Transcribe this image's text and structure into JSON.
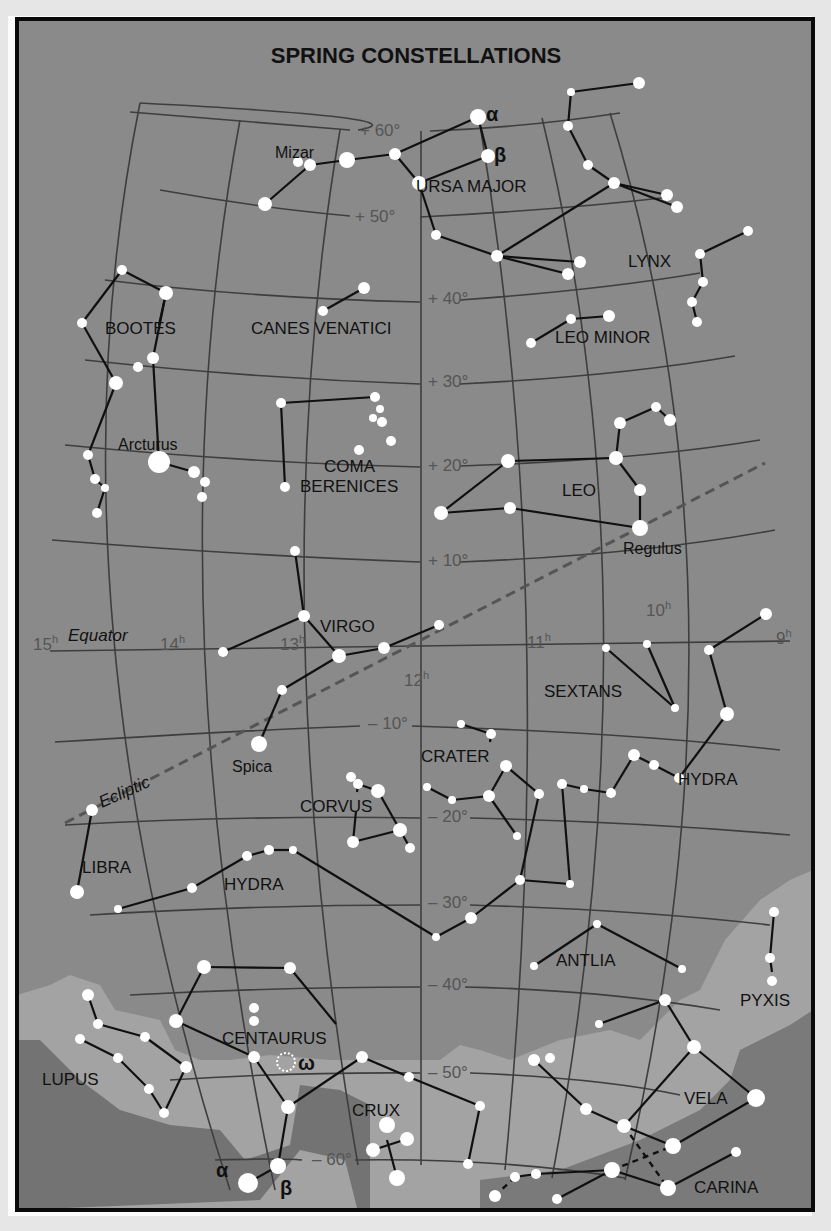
{
  "title": "SPRING CONSTELLATIONS",
  "colors": {
    "background": "#8a8a8a",
    "milky_way_light": "#a3a3a3",
    "milky_way_dark": "#6f6f6f",
    "grid": "#3e3e3e",
    "line": "#101010",
    "star": "#ffffff",
    "ecliptic": "#555555",
    "border": "#0a0a0a"
  },
  "grid_labels": {
    "dec": [
      {
        "text": "+ 60°",
        "x": 360,
        "y": 136
      },
      {
        "text": "+ 50°",
        "x": 355,
        "y": 222
      },
      {
        "text": "+ 40°",
        "x": 428,
        "y": 304
      },
      {
        "text": "+ 30°",
        "x": 428,
        "y": 387
      },
      {
        "text": "+ 20°",
        "x": 428,
        "y": 471
      },
      {
        "text": "+ 10°",
        "x": 428,
        "y": 566
      },
      {
        "text": "– 10°",
        "x": 368,
        "y": 729
      },
      {
        "text": "– 20°",
        "x": 428,
        "y": 822
      },
      {
        "text": "– 30°",
        "x": 428,
        "y": 908
      },
      {
        "text": "– 40°",
        "x": 428,
        "y": 990
      },
      {
        "text": "– 50°",
        "x": 428,
        "y": 1078
      },
      {
        "text": "– 60°",
        "x": 312,
        "y": 1165
      }
    ],
    "ra": [
      {
        "text": "15h",
        "x": 33,
        "y": 650
      },
      {
        "text": "14h",
        "x": 160,
        "y": 650
      },
      {
        "text": "13h",
        "x": 280,
        "y": 650
      },
      {
        "text": "12h",
        "x": 404,
        "y": 686
      },
      {
        "text": "11h",
        "x": 527,
        "y": 648
      },
      {
        "text": "10h",
        "x": 646,
        "y": 616
      },
      {
        "text": "9h",
        "x": 776,
        "y": 644
      }
    ]
  },
  "special_labels": {
    "equator": "Equator",
    "ecliptic": "Ecliptic"
  },
  "constellations": [
    {
      "name": "URSA MAJOR",
      "x": 416,
      "y": 192
    },
    {
      "name": "LYNX",
      "x": 628,
      "y": 267
    },
    {
      "name": "LEO MINOR",
      "x": 555,
      "y": 343
    },
    {
      "name": "BOOTES",
      "x": 105,
      "y": 334
    },
    {
      "name": "CANES VENATICI",
      "x": 251,
      "y": 334
    },
    {
      "name": "COMA",
      "x": 324,
      "y": 472
    },
    {
      "name": "BERENICES",
      "x": 300,
      "y": 492
    },
    {
      "name": "LEO",
      "x": 562,
      "y": 496
    },
    {
      "name": "VIRGO",
      "x": 320,
      "y": 632
    },
    {
      "name": "SEXTANS",
      "x": 544,
      "y": 697
    },
    {
      "name": "CRATER",
      "x": 421,
      "y": 762
    },
    {
      "name": "HYDRA",
      "x": 678,
      "y": 785
    },
    {
      "name": "CORVUS",
      "x": 300,
      "y": 812
    },
    {
      "name": "LIBRA",
      "x": 82,
      "y": 873
    },
    {
      "name": "HYDRA",
      "x": 224,
      "y": 890
    },
    {
      "name": "ANTLIA",
      "x": 556,
      "y": 966
    },
    {
      "name": "PYXIS",
      "x": 740,
      "y": 1006
    },
    {
      "name": "CENTAURUS",
      "x": 222,
      "y": 1044
    },
    {
      "name": "LUPUS",
      "x": 42,
      "y": 1085
    },
    {
      "name": "CRUX",
      "x": 352,
      "y": 1116
    },
    {
      "name": "VELA",
      "x": 684,
      "y": 1104
    },
    {
      "name": "CARINA",
      "x": 694,
      "y": 1193
    }
  ],
  "star_names": [
    {
      "name": "Mizar",
      "x": 275,
      "y": 158
    },
    {
      "name": "Arcturus",
      "x": 118,
      "y": 450
    },
    {
      "name": "Regulus",
      "x": 623,
      "y": 554
    },
    {
      "name": "Spica",
      "x": 232,
      "y": 772
    }
  ],
  "greek_labels": [
    {
      "text": "α",
      "x": 486,
      "y": 121
    },
    {
      "text": "β",
      "x": 494,
      "y": 162
    },
    {
      "text": "ω",
      "x": 298,
      "y": 1070
    },
    {
      "text": "α",
      "x": 216,
      "y": 1177
    },
    {
      "text": "β",
      "x": 280,
      "y": 1195
    }
  ],
  "stars": [
    [
      478,
      117,
      8
    ],
    [
      488,
      156,
      7
    ],
    [
      419,
      183,
      7
    ],
    [
      395,
      154,
      6
    ],
    [
      347,
      160,
      8
    ],
    [
      310,
      165,
      6
    ],
    [
      298,
      162,
      5
    ],
    [
      265,
      204,
      7
    ],
    [
      436,
      235,
      5
    ],
    [
      497,
      256,
      6
    ],
    [
      568,
      274,
      6
    ],
    [
      580,
      262,
      6
    ],
    [
      571,
      92,
      4
    ],
    [
      639,
      83,
      6
    ],
    [
      568,
      126,
      5
    ],
    [
      588,
      165,
      5
    ],
    [
      614,
      183,
      6
    ],
    [
      677,
      207,
      6
    ],
    [
      667,
      195,
      6
    ],
    [
      700,
      254,
      5
    ],
    [
      748,
      231,
      5
    ],
    [
      703,
      282,
      5
    ],
    [
      692,
      302,
      5
    ],
    [
      697,
      322,
      5
    ],
    [
      531,
      343,
      5
    ],
    [
      571,
      319,
      5
    ],
    [
      609,
      316,
      6
    ],
    [
      122,
      270,
      5
    ],
    [
      166,
      293,
      7
    ],
    [
      82,
      323,
      5
    ],
    [
      153,
      358,
      6
    ],
    [
      138,
      367,
      5
    ],
    [
      116,
      383,
      7
    ],
    [
      159,
      462,
      11
    ],
    [
      194,
      472,
      6
    ],
    [
      205,
      482,
      5
    ],
    [
      202,
      497,
      5
    ],
    [
      88,
      455,
      5
    ],
    [
      95,
      479,
      5
    ],
    [
      105,
      488,
      4
    ],
    [
      97,
      513,
      5
    ],
    [
      323,
      311,
      5
    ],
    [
      364,
      288,
      6
    ],
    [
      281,
      403,
      5
    ],
    [
      375,
      397,
      5
    ],
    [
      380,
      409,
      4
    ],
    [
      373,
      418,
      4
    ],
    [
      382,
      422,
      5
    ],
    [
      391,
      441,
      5
    ],
    [
      359,
      450,
      5
    ],
    [
      285,
      487,
      5
    ],
    [
      508,
      461,
      7
    ],
    [
      616,
      458,
      7
    ],
    [
      620,
      423,
      6
    ],
    [
      656,
      407,
      5
    ],
    [
      670,
      420,
      6
    ],
    [
      640,
      490,
      6
    ],
    [
      640,
      528,
      8
    ],
    [
      510,
      508,
      6
    ],
    [
      441,
      513,
      7
    ],
    [
      295,
      551,
      5
    ],
    [
      304,
      616,
      6
    ],
    [
      339,
      656,
      7
    ],
    [
      384,
      648,
      6
    ],
    [
      439,
      625,
      5
    ],
    [
      282,
      690,
      5
    ],
    [
      259,
      744,
      8
    ],
    [
      223,
      652,
      5
    ],
    [
      606,
      648,
      4
    ],
    [
      647,
      644,
      4
    ],
    [
      675,
      708,
      4
    ],
    [
      709,
      650,
      5
    ],
    [
      766,
      614,
      6
    ],
    [
      727,
      714,
      7
    ],
    [
      461,
      724,
      4
    ],
    [
      491,
      734,
      5
    ],
    [
      506,
      766,
      6
    ],
    [
      489,
      796,
      6
    ],
    [
      452,
      800,
      4
    ],
    [
      427,
      787,
      4
    ],
    [
      517,
      836,
      4
    ],
    [
      539,
      794,
      5
    ],
    [
      351,
      777,
      5
    ],
    [
      358,
      784,
      5
    ],
    [
      378,
      791,
      7
    ],
    [
      353,
      842,
      6
    ],
    [
      400,
      830,
      7
    ],
    [
      410,
      848,
      5
    ],
    [
      562,
      784,
      5
    ],
    [
      584,
      789,
      4
    ],
    [
      611,
      793,
      5
    ],
    [
      634,
      755,
      6
    ],
    [
      654,
      765,
      5
    ],
    [
      679,
      778,
      5
    ],
    [
      92,
      810,
      6
    ],
    [
      77,
      892,
      7
    ],
    [
      118,
      909,
      4
    ],
    [
      192,
      888,
      5
    ],
    [
      247,
      856,
      5
    ],
    [
      269,
      850,
      5
    ],
    [
      293,
      850,
      4
    ],
    [
      436,
      937,
      4
    ],
    [
      471,
      918,
      6
    ],
    [
      520,
      880,
      5
    ],
    [
      570,
      884,
      4
    ],
    [
      597,
      924,
      4
    ],
    [
      534,
      966,
      4
    ],
    [
      682,
      969,
      4
    ],
    [
      774,
      912,
      5
    ],
    [
      770,
      958,
      5
    ],
    [
      772,
      981,
      5
    ],
    [
      204,
      967,
      7
    ],
    [
      290,
      968,
      6
    ],
    [
      254,
      1008,
      5
    ],
    [
      254,
      1021,
      5
    ],
    [
      176,
      1021,
      7
    ],
    [
      254,
      1057,
      6
    ],
    [
      362,
      1057,
      6
    ],
    [
      288,
      1107,
      7
    ],
    [
      278,
      1166,
      8
    ],
    [
      248,
      1183,
      10
    ],
    [
      409,
      1077,
      5
    ],
    [
      480,
      1106,
      5
    ],
    [
      88,
      995,
      6
    ],
    [
      98,
      1024,
      5
    ],
    [
      80,
      1039,
      5
    ],
    [
      118,
      1058,
      5
    ],
    [
      145,
      1037,
      5
    ],
    [
      149,
      1089,
      5
    ],
    [
      186,
      1067,
      6
    ],
    [
      164,
      1113,
      5
    ],
    [
      387,
      1125,
      8
    ],
    [
      407,
      1139,
      7
    ],
    [
      373,
      1150,
      7
    ],
    [
      397,
      1178,
      8
    ],
    [
      468,
      1164,
      5
    ],
    [
      599,
      1024,
      4
    ],
    [
      665,
      1000,
      6
    ],
    [
      694,
      1047,
      7
    ],
    [
      534,
      1060,
      6
    ],
    [
      550,
      1058,
      5
    ],
    [
      586,
      1109,
      6
    ],
    [
      624,
      1126,
      7
    ],
    [
      673,
      1146,
      8
    ],
    [
      756,
      1098,
      9
    ],
    [
      612,
      1170,
      8
    ],
    [
      668,
      1188,
      8
    ],
    [
      736,
      1152,
      5
    ],
    [
      536,
      1174,
      5
    ],
    [
      515,
      1177,
      5
    ],
    [
      495,
      1196,
      6
    ],
    [
      557,
      1199,
      5
    ]
  ],
  "lines": [
    [
      265,
      204,
      310,
      165
    ],
    [
      310,
      165,
      347,
      160
    ],
    [
      347,
      160,
      395,
      154
    ],
    [
      395,
      154,
      478,
      117
    ],
    [
      478,
      117,
      488,
      156
    ],
    [
      488,
      156,
      419,
      183
    ],
    [
      395,
      154,
      419,
      183
    ],
    [
      419,
      183,
      436,
      235
    ],
    [
      436,
      235,
      497,
      256
    ],
    [
      497,
      256,
      568,
      274
    ],
    [
      497,
      256,
      580,
      262
    ],
    [
      497,
      256,
      614,
      183
    ],
    [
      571,
      92,
      639,
      83
    ],
    [
      571,
      92,
      568,
      126
    ],
    [
      568,
      126,
      588,
      165
    ],
    [
      588,
      165,
      614,
      183
    ],
    [
      614,
      183,
      677,
      207
    ],
    [
      614,
      183,
      667,
      195
    ],
    [
      700,
      254,
      748,
      231
    ],
    [
      700,
      254,
      703,
      282
    ],
    [
      703,
      282,
      692,
      302
    ],
    [
      692,
      302,
      697,
      322
    ],
    [
      531,
      343,
      571,
      319
    ],
    [
      571,
      319,
      609,
      316
    ],
    [
      122,
      270,
      166,
      293
    ],
    [
      122,
      270,
      82,
      323
    ],
    [
      82,
      323,
      116,
      383
    ],
    [
      116,
      383,
      88,
      455
    ],
    [
      166,
      293,
      159,
      325
    ],
    [
      153,
      358,
      159,
      462
    ],
    [
      159,
      462,
      194,
      472
    ],
    [
      88,
      455,
      95,
      479
    ],
    [
      95,
      479,
      105,
      488
    ],
    [
      105,
      488,
      97,
      513
    ],
    [
      166,
      293,
      153,
      358
    ],
    [
      323,
      311,
      364,
      288
    ],
    [
      281,
      403,
      375,
      397
    ],
    [
      281,
      403,
      285,
      487
    ],
    [
      441,
      513,
      508,
      461
    ],
    [
      508,
      461,
      616,
      458
    ],
    [
      616,
      458,
      620,
      423
    ],
    [
      620,
      423,
      656,
      407
    ],
    [
      656,
      407,
      670,
      420
    ],
    [
      616,
      458,
      640,
      490
    ],
    [
      640,
      490,
      640,
      528
    ],
    [
      640,
      528,
      510,
      508
    ],
    [
      510,
      508,
      441,
      513
    ],
    [
      295,
      551,
      304,
      616
    ],
    [
      304,
      616,
      223,
      652
    ],
    [
      304,
      616,
      339,
      656
    ],
    [
      339,
      656,
      384,
      648
    ],
    [
      384,
      648,
      439,
      625
    ],
    [
      339,
      656,
      282,
      690
    ],
    [
      282,
      690,
      259,
      744
    ],
    [
      606,
      648,
      675,
      708
    ],
    [
      647,
      644,
      675,
      708
    ],
    [
      709,
      650,
      766,
      614
    ],
    [
      709,
      650,
      727,
      714
    ],
    [
      727,
      714,
      679,
      778
    ],
    [
      679,
      778,
      654,
      765
    ],
    [
      654,
      765,
      634,
      755
    ],
    [
      634,
      755,
      611,
      793
    ],
    [
      611,
      793,
      584,
      789
    ],
    [
      584,
      789,
      562,
      784
    ],
    [
      562,
      784,
      570,
      884
    ],
    [
      461,
      724,
      491,
      734
    ],
    [
      491,
      734,
      490,
      742
    ],
    [
      506,
      766,
      489,
      796
    ],
    [
      489,
      796,
      452,
      800
    ],
    [
      452,
      800,
      427,
      787
    ],
    [
      489,
      796,
      517,
      836
    ],
    [
      506,
      766,
      539,
      794
    ],
    [
      539,
      794,
      520,
      880
    ],
    [
      358,
      784,
      378,
      791
    ],
    [
      378,
      791,
      400,
      830
    ],
    [
      400,
      830,
      353,
      842
    ],
    [
      353,
      842,
      356,
      811
    ],
    [
      400,
      830,
      410,
      848
    ],
    [
      358,
      784,
      357,
      792
    ],
    [
      92,
      810,
      77,
      892
    ],
    [
      118,
      909,
      192,
      888
    ],
    [
      192,
      888,
      247,
      856
    ],
    [
      247,
      856,
      269,
      850
    ],
    [
      269,
      850,
      293,
      850
    ],
    [
      293,
      850,
      436,
      937
    ],
    [
      436,
      937,
      471,
      918
    ],
    [
      471,
      918,
      520,
      880
    ],
    [
      520,
      880,
      570,
      884
    ],
    [
      534,
      966,
      597,
      924
    ],
    [
      597,
      924,
      682,
      969
    ],
    [
      774,
      912,
      770,
      958
    ],
    [
      770,
      958,
      772,
      972
    ],
    [
      204,
      967,
      290,
      968
    ],
    [
      204,
      967,
      176,
      1021
    ],
    [
      176,
      1021,
      254,
      1057
    ],
    [
      290,
      968,
      336,
      1024
    ],
    [
      254,
      1057,
      288,
      1107
    ],
    [
      288,
      1107,
      362,
      1057
    ],
    [
      362,
      1057,
      409,
      1077
    ],
    [
      288,
      1107,
      278,
      1166
    ],
    [
      278,
      1166,
      248,
      1183
    ],
    [
      88,
      995,
      98,
      1024
    ],
    [
      98,
      1024,
      145,
      1037
    ],
    [
      145,
      1037,
      186,
      1067
    ],
    [
      186,
      1067,
      164,
      1113
    ],
    [
      80,
      1039,
      118,
      1058
    ],
    [
      118,
      1058,
      149,
      1089
    ],
    [
      149,
      1089,
      164,
      1113
    ],
    [
      409,
      1077,
      480,
      1106
    ],
    [
      480,
      1106,
      468,
      1164
    ],
    [
      387,
      1140,
      397,
      1178
    ],
    [
      373,
      1150,
      407,
      1139
    ],
    [
      599,
      1024,
      665,
      1000
    ],
    [
      665,
      1000,
      694,
      1047
    ],
    [
      694,
      1047,
      756,
      1098
    ],
    [
      756,
      1098,
      673,
      1146
    ],
    [
      673,
      1146,
      624,
      1126
    ],
    [
      624,
      1126,
      694,
      1047
    ],
    [
      534,
      1060,
      586,
      1109
    ],
    [
      586,
      1109,
      624,
      1126
    ],
    [
      612,
      1170,
      668,
      1188
    ],
    [
      668,
      1188,
      736,
      1152
    ],
    [
      612,
      1170,
      557,
      1199
    ],
    [
      612,
      1170,
      536,
      1174
    ],
    [
      536,
      1174,
      515,
      1177
    ]
  ],
  "dashed_lines": [
    [
      515,
      1177,
      495,
      1196
    ],
    [
      624,
      1126,
      668,
      1188
    ],
    [
      612,
      1170,
      673,
      1146
    ]
  ],
  "chart_data": {
    "type": "star_chart",
    "title": "SPRING CONSTELLATIONS",
    "ra_hours": [
      "15h",
      "14h",
      "13h",
      "12h",
      "11h",
      "10h",
      "9h"
    ],
    "declinations": [
      "+60°",
      "+50°",
      "+40°",
      "+30°",
      "+20°",
      "+10°",
      "0° (Equator)",
      "-10°",
      "-20°",
      "-30°",
      "-40°",
      "-50°",
      "-60°"
    ],
    "constellations": [
      "Ursa Major",
      "Lynx",
      "Leo Minor",
      "Bootes",
      "Canes Venatici",
      "Coma Berenices",
      "Leo",
      "Virgo",
      "Sextans",
      "Crater",
      "Hydra",
      "Corvus",
      "Libra",
      "Antlia",
      "Pyxis",
      "Centaurus",
      "Lupus",
      "Crux",
      "Vela",
      "Carina"
    ],
    "named_stars": [
      "Mizar",
      "Arcturus",
      "Regulus",
      "Spica"
    ],
    "annotations": [
      "Equator",
      "Ecliptic",
      "α",
      "β",
      "ω"
    ]
  }
}
